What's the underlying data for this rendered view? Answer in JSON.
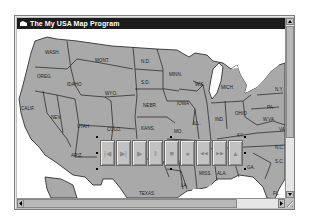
{
  "window": {
    "title": "The My USA Map Program",
    "icon": "app-system-menu-icon"
  },
  "map": {
    "state_labels": [
      {
        "id": "wash",
        "label": "WASH.",
        "x": 28,
        "y": 25
      },
      {
        "id": "oreg",
        "label": "OREG.",
        "x": 20,
        "y": 49
      },
      {
        "id": "idaho",
        "label": "IDAHO",
        "x": 52,
        "y": 57
      },
      {
        "id": "mont",
        "label": "MONT.",
        "x": 80,
        "y": 33
      },
      {
        "id": "nd",
        "label": "N.D.",
        "x": 124,
        "y": 34
      },
      {
        "id": "minn",
        "label": "MINN.",
        "x": 155,
        "y": 47
      },
      {
        "id": "wis",
        "label": "WIS.",
        "x": 180,
        "y": 57
      },
      {
        "id": "mich",
        "label": "MICH.",
        "x": 205,
        "y": 59
      },
      {
        "id": "ny",
        "label": "N.Y.",
        "x": 260,
        "y": 61
      },
      {
        "id": "pa",
        "label": "PA.",
        "x": 250,
        "y": 77
      },
      {
        "id": "sd",
        "label": "S.D.",
        "x": 124,
        "y": 55
      },
      {
        "id": "wyo",
        "label": "WYO.",
        "x": 90,
        "y": 65
      },
      {
        "id": "calif",
        "label": "CALIF.",
        "x": 4,
        "y": 81
      },
      {
        "id": "nev",
        "label": "NEV.",
        "x": 36,
        "y": 90
      },
      {
        "id": "utah",
        "label": "UTAH",
        "x": 60,
        "y": 99
      },
      {
        "id": "colo",
        "label": "COLO.",
        "x": 90,
        "y": 102
      },
      {
        "id": "nebr",
        "label": "NEBR.",
        "x": 126,
        "y": 78
      },
      {
        "id": "iowa",
        "label": "IOWA",
        "x": 162,
        "y": 73
      },
      {
        "id": "ill",
        "label": "ILL.",
        "x": 177,
        "y": 95
      },
      {
        "id": "ind",
        "label": "IND.",
        "x": 199,
        "y": 91
      },
      {
        "id": "ohio",
        "label": "OHIO",
        "x": 220,
        "y": 84
      },
      {
        "id": "wva",
        "label": "W.VA.",
        "x": 248,
        "y": 90
      },
      {
        "id": "va",
        "label": "VA.",
        "x": 264,
        "y": 100
      },
      {
        "id": "kans",
        "label": "KANS.",
        "x": 124,
        "y": 100
      },
      {
        "id": "mo",
        "label": "MO.",
        "x": 157,
        "y": 103
      },
      {
        "id": "ky",
        "label": "KY.",
        "x": 220,
        "y": 106
      },
      {
        "id": "nc",
        "label": "N.C.",
        "x": 262,
        "y": 117
      },
      {
        "id": "sc",
        "label": "S.C.",
        "x": 262,
        "y": 132
      },
      {
        "id": "ariz",
        "label": "ARIZ.",
        "x": 55,
        "y": 126
      },
      {
        "id": "miss",
        "label": "MISS.",
        "x": 184,
        "y": 145
      },
      {
        "id": "ala",
        "label": "ALA.",
        "x": 202,
        "y": 145
      },
      {
        "id": "ga",
        "label": "GA.",
        "x": 232,
        "y": 139
      },
      {
        "id": "texas",
        "label": "TEXAS",
        "x": 124,
        "y": 166
      },
      {
        "id": "la",
        "label": "LA.",
        "x": 166,
        "y": 156
      },
      {
        "id": "fla",
        "label": "FL.",
        "x": 258,
        "y": 166
      }
    ],
    "colors": {
      "land": "#a9a9a9",
      "water": "#ffffff",
      "border": "#1e1e1e"
    }
  },
  "media_controls": {
    "buttons": [
      {
        "name": "previous-button",
        "icon": "skip-back-icon",
        "glyph": "|◀"
      },
      {
        "name": "step-button",
        "icon": "step-forward-icon",
        "glyph": "▶|"
      },
      {
        "name": "play-button",
        "icon": "play-icon",
        "glyph": "▶"
      },
      {
        "name": "pause-button",
        "icon": "pause-icon",
        "glyph": "‖"
      },
      {
        "name": "stop-button",
        "icon": "stop-icon",
        "glyph": "■"
      },
      {
        "name": "record-button",
        "icon": "record-icon",
        "glyph": "●"
      },
      {
        "name": "rewind-button",
        "icon": "rewind-icon",
        "glyph": "◀◀"
      },
      {
        "name": "fast-forward-button",
        "icon": "fast-forward-icon",
        "glyph": "▶▶"
      },
      {
        "name": "eject-button",
        "icon": "eject-icon",
        "glyph": "▲"
      }
    ]
  },
  "scrollbars": {
    "vertical": {
      "up": "▲",
      "down": "▼"
    },
    "horizontal": {
      "left": "◀",
      "right": "▶"
    }
  }
}
